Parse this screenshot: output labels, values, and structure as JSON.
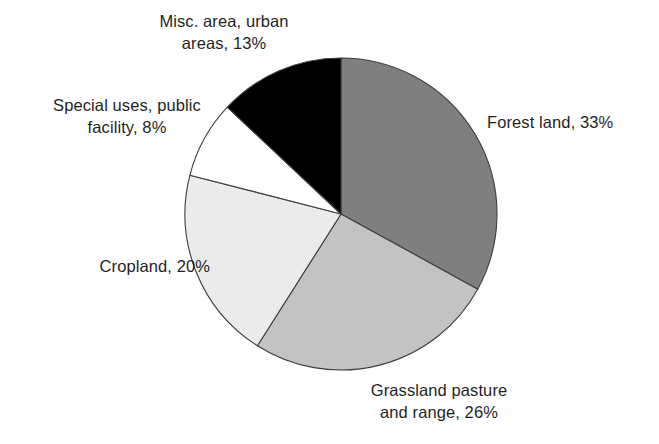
{
  "chart_data": {
    "type": "pie",
    "title": "",
    "subtitle": "",
    "xlabel": "",
    "ylabel": "",
    "legend_position": "none",
    "grid": false,
    "labels_outside": true,
    "unit": "%",
    "start_angle_deg": 0,
    "direction": "clockwise",
    "categories": [
      "Forest land",
      "Grassland pasture and range",
      "Cropland",
      "Special uses, public facility",
      "Misc. area, urban areas"
    ],
    "values": [
      33,
      26,
      20,
      8,
      13
    ],
    "colors": [
      "#7f7f7f",
      "#c3c3c3",
      "#ebebeb",
      "#ffffff",
      "#000000"
    ],
    "slices": [
      {
        "name": "Forest land",
        "value": 33,
        "label": "Forest land, 33%",
        "color": "#7f7f7f",
        "start_deg": 0,
        "end_deg": 118.8
      },
      {
        "name": "Grassland pasture and range",
        "value": 26,
        "label": "Grassland pasture\nand range, 26%",
        "color": "#c3c3c3",
        "start_deg": 118.8,
        "end_deg": 212.4
      },
      {
        "name": "Cropland",
        "value": 20,
        "label": "Cropland, 20%",
        "color": "#ebebeb",
        "start_deg": 212.4,
        "end_deg": 284.4
      },
      {
        "name": "Special uses, public facility",
        "value": 8,
        "label": "Special uses, public\nfacility, 8%",
        "color": "#ffffff",
        "start_deg": 284.4,
        "end_deg": 313.2
      },
      {
        "name": "Misc. area, urban areas",
        "value": 13,
        "label": "Misc. area, urban\nareas, 13%",
        "color": "#000000",
        "start_deg": 313.2,
        "end_deg": 360
      }
    ]
  },
  "labels": {
    "misc": "Misc. area, urban\nareas, 13%",
    "special": "Special uses, public\nfacility, 8%",
    "cropland": "Cropland, 20%",
    "grassland": "Grassland pasture\nand range, 26%",
    "forest": "Forest land, 33%"
  }
}
